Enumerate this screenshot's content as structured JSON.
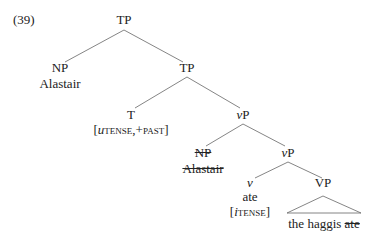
{
  "example_number": "(39)",
  "nodes": {
    "root_tp": "TP",
    "np_subject": "NP",
    "np_subject_word": "Alastair",
    "tp_mid": "TP",
    "t_head": "T",
    "t_features_open": "[",
    "t_features_u": "u",
    "t_features_tense": "tense",
    "t_features_rest": ",+past",
    "t_features_close": "]",
    "vp_upper_v": "v",
    "vp_upper_p": "P",
    "np_trace": "NP",
    "np_trace_word": "Alastair",
    "vp_lower_v": "v",
    "vp_lower_p": "P",
    "v_head": "v",
    "v_word": "ate",
    "v_features_open": "[",
    "v_features_i": "i",
    "v_features_tense": "tense",
    "v_features_close": "]",
    "vp_phrase": "VP",
    "vp_content_main": "the haggis ",
    "vp_content_struck": "ate"
  },
  "colors": {
    "line": "#555555",
    "text": "#222222"
  }
}
